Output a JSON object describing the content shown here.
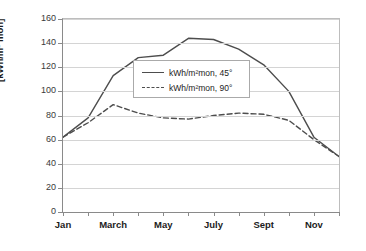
{
  "chart_data": {
    "type": "line",
    "title": "",
    "xlabel": "",
    "ylabel": "[kWh/m² mon]",
    "ylim": [
      0,
      160
    ],
    "ytick_step": 20,
    "yticks": [
      "0",
      "20",
      "40",
      "60",
      "80",
      "100",
      "120",
      "140",
      "160"
    ],
    "grid": true,
    "legend_position": "inside-upper-left",
    "categories": [
      "Jan",
      "Feb",
      "March",
      "April",
      "May",
      "June",
      "July",
      "Aug",
      "Sept",
      "Oct",
      "Nov",
      "Dec"
    ],
    "xtick_labels": [
      "Jan",
      "",
      "March",
      "",
      "May",
      "",
      "July",
      "",
      "Sept",
      "",
      "Nov",
      ""
    ],
    "series": [
      {
        "name": "kWh/m²mon, 45°",
        "style": "solid",
        "color": "#4d4d4d",
        "values": [
          62,
          78,
          113,
          128,
          130,
          144,
          143,
          135,
          122,
          100,
          62,
          46
        ]
      },
      {
        "name": "kWh/m²mon, 90°",
        "style": "dashed",
        "color": "#4d4d4d",
        "values": [
          62,
          74,
          89,
          82,
          78,
          77,
          80,
          82,
          81,
          76,
          60,
          46
        ]
      }
    ]
  },
  "legend": {
    "entries": [
      {
        "label": "kWh/m²mon, 45°",
        "style": "solid"
      },
      {
        "label": "kWh/m²mon, 90°",
        "style": "dashed"
      }
    ]
  },
  "axes": {
    "y_title": "[kWh/m² mon]"
  }
}
